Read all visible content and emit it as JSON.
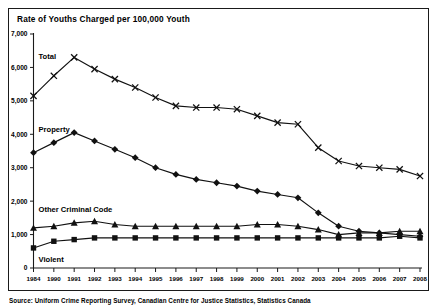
{
  "figure": {
    "title": "Rate of Youths Charged per 100,000 Youth",
    "source": "Source: Uniform Crime Reporting Survey, Canadian Centre for Justice Statistics, Statistics Canada"
  },
  "colors": {
    "frame": "#1a1a1a",
    "line": "#111111",
    "background": "#ffffff"
  },
  "chart_data": {
    "type": "line",
    "title": "Rate of Youths Charged per 100,000 Youth",
    "xlabel": "",
    "ylabel": "",
    "ylim": [
      0,
      7000
    ],
    "ytick_labels": [
      "7,000",
      "6,000",
      "5,000",
      "4,000",
      "3,000",
      "2,000",
      "1,000",
      "0"
    ],
    "ytick_values": [
      7000,
      6000,
      5000,
      4000,
      3000,
      2000,
      1000,
      0
    ],
    "grid": false,
    "legend_position": "inline-labels",
    "categories": [
      "1984",
      "1990",
      "1991",
      "1992",
      "1993",
      "1994",
      "1995",
      "1996",
      "1997",
      "1998",
      "1999",
      "2000",
      "2001",
      "2002",
      "2003",
      "2004",
      "2005",
      "2006",
      "2007",
      "2008"
    ],
    "series": [
      {
        "name": "Total",
        "marker": "x",
        "label_x_index": 1,
        "values": [
          5150,
          5750,
          6300,
          5950,
          5650,
          5400,
          5100,
          4850,
          4800,
          4800,
          4750,
          4550,
          4350,
          4300,
          3600,
          3200,
          3050,
          3000,
          2950,
          2750
        ]
      },
      {
        "name": "Property",
        "marker": "diamond",
        "label_x_index": 1,
        "values": [
          3450,
          3750,
          4050,
          3800,
          3550,
          3300,
          3000,
          2800,
          2650,
          2550,
          2450,
          2300,
          2200,
          2100,
          1650,
          1250,
          1100,
          1050,
          1000,
          950
        ]
      },
      {
        "name": "Other Criminal Code",
        "marker": "triangle",
        "label_x_index": 1,
        "values": [
          1200,
          1250,
          1350,
          1400,
          1300,
          1250,
          1250,
          1250,
          1250,
          1250,
          1250,
          1300,
          1300,
          1250,
          1150,
          1000,
          1050,
          1050,
          1100,
          1100
        ]
      },
      {
        "name": "Violent",
        "marker": "square",
        "label_x_index": 1,
        "values": [
          600,
          800,
          850,
          900,
          900,
          900,
          900,
          900,
          900,
          900,
          900,
          900,
          900,
          900,
          900,
          900,
          900,
          900,
          950,
          900
        ]
      }
    ]
  }
}
